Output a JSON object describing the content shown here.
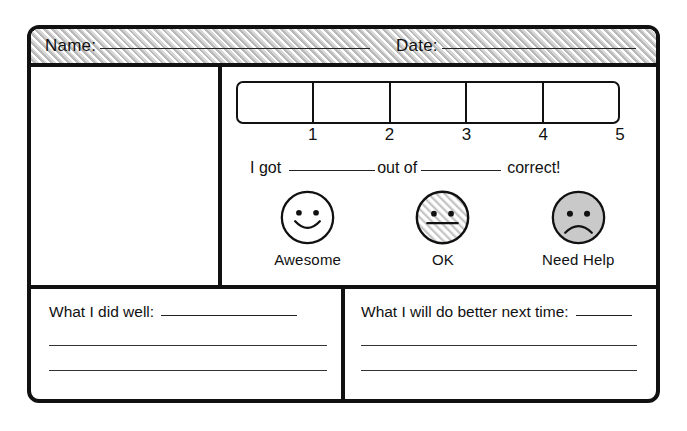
{
  "header": {
    "name_label": "Name:",
    "date_label": "Date:"
  },
  "rating": {
    "scale_numbers": [
      "1",
      "2",
      "3",
      "4",
      "5"
    ],
    "cell_count": 5
  },
  "score_line": {
    "prefix": "I got",
    "middle": "out of",
    "suffix": "correct!"
  },
  "faces": [
    {
      "label": "Awesome",
      "icon": "smiley-face-icon",
      "fill": "#ffffff",
      "mouth": "smile"
    },
    {
      "label": "OK",
      "icon": "neutral-face-icon",
      "fill": "hatched",
      "mouth": "flat"
    },
    {
      "label": "Need Help",
      "icon": "sad-face-icon",
      "fill": "#c9c9c9",
      "mouth": "frown"
    }
  ],
  "reflection": {
    "did_well_label": "What I did well:",
    "next_time_label": "What I will do better next time:"
  },
  "colors": {
    "ink": "#111111",
    "hatch_gray": "#b9b9b9",
    "sad_face_gray": "#c9c9c9",
    "paper": "#ffffff"
  }
}
